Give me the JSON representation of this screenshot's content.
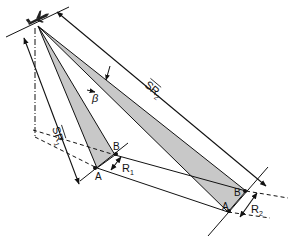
{
  "diagram": {
    "labels": {
      "sr1": "SR",
      "sr1_sub": "1",
      "sr2": "SR",
      "sr2_sub": "2",
      "beta": "β",
      "a_near": "A",
      "b_near": "B",
      "a_far": "A",
      "b_far": "B",
      "r1": "R",
      "r1_sub": "1",
      "r2": "R",
      "r2_sub": "2"
    },
    "icons": {
      "aircraft": "aircraft-icon"
    },
    "colors": {
      "line": "#111111",
      "fill": "#c8c8c8",
      "background": "#ffffff"
    }
  }
}
